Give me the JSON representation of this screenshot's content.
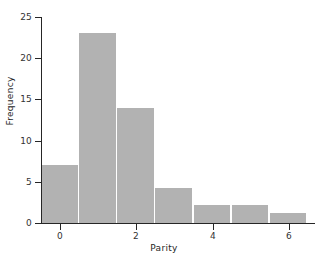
{
  "chart_data": {
    "type": "bar",
    "title": "",
    "subtitle": "",
    "xlabel": "Parity",
    "ylabel": "Frequency",
    "categories": [
      "0",
      "1",
      "2",
      "3",
      "4",
      "5",
      "6"
    ],
    "x": [
      0,
      1,
      2,
      3,
      4,
      5,
      6
    ],
    "values": [
      7,
      23,
      14,
      4.2,
      2.2,
      2.2,
      1.2
    ],
    "bar_width": 1,
    "xlim": [
      -0.5,
      6.5
    ],
    "ylim": [
      0,
      25
    ],
    "xticks": [
      0,
      2,
      4,
      6
    ],
    "xtick_labels": [
      "0",
      "2",
      "4",
      "6"
    ],
    "yticks": [
      0,
      5,
      10,
      15,
      20,
      25
    ],
    "ytick_labels": [
      "0",
      "5",
      "10",
      "15",
      "20",
      "25"
    ],
    "grid": false,
    "legend": null,
    "legend_position": "none",
    "annotations": [],
    "colors": {
      "bar_fill": "#b2b2b2",
      "axis": "#262626",
      "tick_label": "#333333",
      "axis_label": "#262626",
      "background": "#ffffff",
      "bar_separator": "#ffffff"
    }
  }
}
